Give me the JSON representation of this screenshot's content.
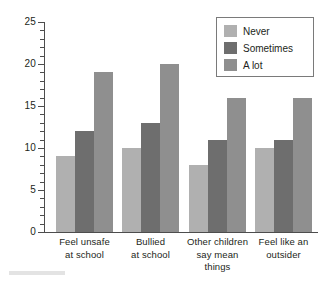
{
  "chart_data": {
    "type": "bar",
    "title": "",
    "subtitle": "",
    "xlabel": "",
    "ylabel": "",
    "ylim": [
      0,
      25
    ],
    "ytick_values": [
      0,
      5,
      10,
      15,
      20,
      25
    ],
    "ytick_labels": [
      "0",
      "5",
      "10",
      "15",
      "20",
      "25"
    ],
    "yminor_step": 1,
    "grid": false,
    "legend_position": "top-right",
    "categories": [
      "Feel unsafe at school",
      "Bullied at school",
      "Other children say mean things",
      "Feel like an outsider"
    ],
    "category_label_lines": [
      [
        "Feel unsafe",
        "at school"
      ],
      [
        "Bullied",
        "at school"
      ],
      [
        "Other children",
        "say mean",
        "things"
      ],
      [
        "Feel like an",
        "outsider"
      ]
    ],
    "series": [
      {
        "name": "Never",
        "color": "#b0b0b0",
        "values": [
          9,
          10,
          8,
          10
        ]
      },
      {
        "name": "Sometimes",
        "color": "#6e6e6e",
        "values": [
          12,
          13,
          11,
          11
        ]
      },
      {
        "name": "A lot",
        "color": "#8f8f8f",
        "values": [
          19,
          20,
          16,
          16
        ]
      }
    ]
  },
  "legend": {
    "items": [
      {
        "label": "Never"
      },
      {
        "label": "Sometimes"
      },
      {
        "label": "A lot"
      }
    ]
  },
  "axis_colors": {
    "axis_line": "#4d4d4d",
    "text": "#231f20",
    "legend_border": "#7a7a7a",
    "background": "#ffffff"
  }
}
